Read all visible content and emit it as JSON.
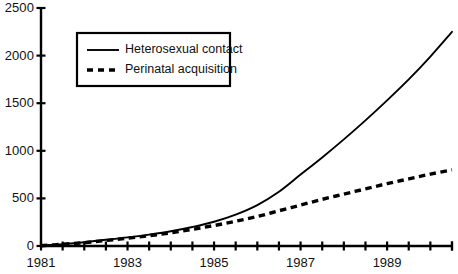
{
  "chart_data": {
    "type": "line",
    "title": "",
    "xlabel": "",
    "ylabel": "",
    "xlim": [
      1981,
      1990.5
    ],
    "ylim": [
      0,
      2500
    ],
    "grid": false,
    "legend_position": "top-left-inset",
    "y_ticks": [
      0,
      500,
      1000,
      1500,
      2000,
      2500
    ],
    "y_tick_labels": [
      "0",
      "500",
      "1000",
      "1500",
      "2000",
      "2500"
    ],
    "x_ticks": [
      1981,
      1981.5,
      1982,
      1982.5,
      1983,
      1983.5,
      1984,
      1984.5,
      1985,
      1985.5,
      1986,
      1986.5,
      1987,
      1987.5,
      1988,
      1988.5,
      1989,
      1989.5,
      1990,
      1990.5
    ],
    "x_tick_labels": [
      "1981",
      "1983",
      "1985",
      "1987",
      "1989"
    ],
    "x_labeled_ticks": [
      1981,
      1983,
      1985,
      1987,
      1989
    ],
    "series": [
      {
        "name": "Heterosexual contact",
        "style": "solid",
        "color": "#000000",
        "x": [
          1981,
          1981.5,
          1982,
          1982.5,
          1983,
          1983.5,
          1984,
          1984.5,
          1985,
          1985.5,
          1986,
          1986.5,
          1987,
          1987.5,
          1988,
          1988.5,
          1989,
          1989.5,
          1990,
          1990.5
        ],
        "values": [
          5,
          20,
          40,
          65,
          90,
          120,
          155,
          200,
          255,
          330,
          430,
          570,
          750,
          930,
          1120,
          1320,
          1530,
          1750,
          1990,
          2250
        ]
      },
      {
        "name": "Perinatal acquisition",
        "style": "dashed",
        "color": "#000000",
        "x": [
          1981,
          1981.5,
          1982,
          1982.5,
          1983,
          1983.5,
          1984,
          1984.5,
          1985,
          1985.5,
          1986,
          1986.5,
          1987,
          1987.5,
          1988,
          1988.5,
          1989,
          1989.5,
          1990,
          1990.5
        ],
        "values": [
          3,
          18,
          35,
          58,
          82,
          108,
          138,
          175,
          215,
          260,
          310,
          370,
          430,
          490,
          545,
          600,
          655,
          705,
          755,
          800
        ]
      }
    ]
  },
  "legend": {
    "items": [
      {
        "label": "Heterosexual contact",
        "style": "solid"
      },
      {
        "label": "Perinatal acquisition",
        "style": "dashed"
      }
    ]
  }
}
